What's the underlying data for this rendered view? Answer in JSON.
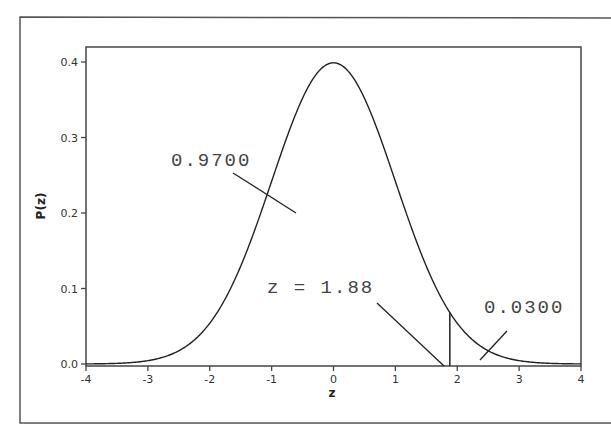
{
  "chart_data": {
    "type": "line",
    "title": "",
    "xlabel": "z",
    "ylabel": "P(z)",
    "xlim": [
      -4,
      4
    ],
    "ylim": [
      0.0,
      0.42
    ],
    "xticks": [
      "-4",
      "-3",
      "-2",
      "-1",
      "0",
      "1",
      "2",
      "3",
      "4"
    ],
    "yticks": [
      "0.0",
      "0.1",
      "0.2",
      "0.3",
      "0.4"
    ],
    "grid": false,
    "legend": null,
    "series": [
      {
        "name": "Standard normal density",
        "x": [
          -4,
          -3.5,
          -3,
          -2.5,
          -2,
          -1.5,
          -1,
          -0.5,
          0,
          0.5,
          1,
          1.5,
          2,
          2.5,
          3,
          3.5,
          4
        ],
        "values": [
          0.0001,
          0.0009,
          0.0044,
          0.0175,
          0.054,
          0.1295,
          0.242,
          0.3521,
          0.3989,
          0.3521,
          0.242,
          0.1295,
          0.054,
          0.0175,
          0.0044,
          0.0009,
          0.0001
        ]
      }
    ],
    "annotations": [
      {
        "text": "0.9700",
        "meaning": "area left of z = 1.88"
      },
      {
        "text": "z = 1.88",
        "meaning": "critical value marker"
      },
      {
        "text": "0.0300",
        "meaning": "area right of z = 1.88"
      }
    ],
    "critical_z": 1.88
  },
  "labels": {
    "xlabel": "z",
    "ylabel": "P(z)",
    "area_left": "0.9700",
    "z_marker": "z = 1.88",
    "area_right": "0.0300",
    "xticks": [
      "-4",
      "-3",
      "-2",
      "-1",
      "0",
      "1",
      "2",
      "3",
      "4"
    ],
    "yticks": [
      "0.0",
      "0.1",
      "0.2",
      "0.3",
      "0.4"
    ]
  }
}
